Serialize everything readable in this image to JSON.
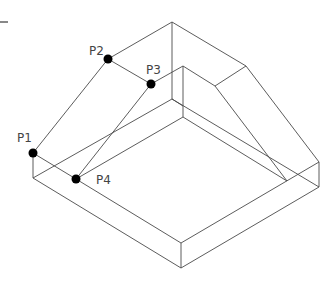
{
  "diagram": {
    "type": "isometric-wireframe",
    "colors": {
      "edge": "#4a4a4a",
      "point": "#000000",
      "label": "#444444"
    },
    "points": [
      {
        "id": "P1",
        "label": "P1",
        "x": 33,
        "y": 153,
        "lx": 17,
        "ly": 140
      },
      {
        "id": "P2",
        "label": "P2",
        "x": 108,
        "y": 59,
        "lx": 90,
        "ly": 54
      },
      {
        "id": "P3",
        "label": "P3",
        "x": 151,
        "y": 84,
        "lx": 146,
        "ly": 73
      },
      {
        "id": "P4",
        "label": "P4",
        "x": 76,
        "y": 179,
        "lx": 97,
        "ly": 183
      }
    ]
  }
}
